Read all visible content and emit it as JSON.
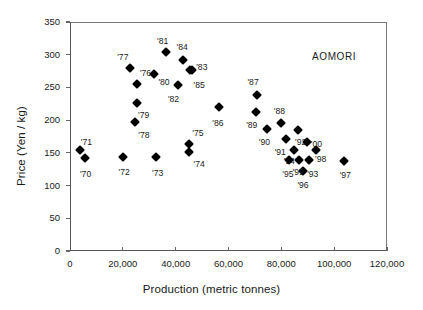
{
  "chart_data": {
    "type": "scatter",
    "title": "",
    "annotation": "AOMORI",
    "xlabel": "Production (metric tonnes)",
    "ylabel": "Price (Yen / kg)",
    "xlim": [
      0,
      120000
    ],
    "ylim": [
      0,
      350
    ],
    "xticks": [
      0,
      20000,
      40000,
      60000,
      80000,
      100000,
      120000
    ],
    "xticklabels": [
      "0",
      "20,000",
      "40,000",
      "60,000",
      "80,000",
      "100,000",
      "120,000"
    ],
    "yticks": [
      0,
      50,
      100,
      150,
      200,
      250,
      300,
      350
    ],
    "yticklabels": [
      "0",
      "50",
      "100",
      "150",
      "200",
      "250",
      "300",
      "350"
    ],
    "grid": false,
    "legend": "none",
    "marker": "filled-diamond",
    "marker_color": "#000000",
    "points": [
      {
        "label": "'70",
        "x": 5700,
        "y": 142,
        "lx": 5900,
        "ly": 118
      },
      {
        "label": "'71",
        "x": 3900,
        "y": 155,
        "lx": 6200,
        "ly": 167
      },
      {
        "label": "'72",
        "x": 20100,
        "y": 144,
        "lx": 20500,
        "ly": 120
      },
      {
        "label": "'73",
        "x": 32600,
        "y": 143,
        "lx": 33200,
        "ly": 119
      },
      {
        "label": "'74",
        "x": 44900,
        "y": 152,
        "lx": 48900,
        "ly": 133
      },
      {
        "label": "'75",
        "x": 44900,
        "y": 163,
        "lx": 48400,
        "ly": 181
      },
      {
        "label": "'76",
        "x": 25500,
        "y": 256,
        "lx": 28600,
        "ly": 272
      },
      {
        "label": "'77",
        "x": 22900,
        "y": 280,
        "lx": 20000,
        "ly": 296
      },
      {
        "label": "'78",
        "x": 24600,
        "y": 197,
        "lx": 28000,
        "ly": 178
      },
      {
        "label": "'79",
        "x": 25300,
        "y": 226,
        "lx": 27900,
        "ly": 208
      },
      {
        "label": "'80",
        "x": 31800,
        "y": 270,
        "lx": 35600,
        "ly": 258
      },
      {
        "label": "'81",
        "x": 36500,
        "y": 304,
        "lx": 35100,
        "ly": 321
      },
      {
        "label": "'82",
        "x": 40800,
        "y": 254,
        "lx": 39200,
        "ly": 233
      },
      {
        "label": "'83",
        "x": 46200,
        "y": 277,
        "lx": 49900,
        "ly": 281
      },
      {
        "label": "'84",
        "x": 42900,
        "y": 292,
        "lx": 42500,
        "ly": 312
      },
      {
        "label": "'85",
        "x": 45300,
        "y": 277,
        "lx": 48900,
        "ly": 253
      },
      {
        "label": "'86",
        "x": 56500,
        "y": 220,
        "lx": 56000,
        "ly": 196
      },
      {
        "label": "'87",
        "x": 70800,
        "y": 238,
        "lx": 69300,
        "ly": 259
      },
      {
        "label": "'88",
        "x": 79800,
        "y": 196,
        "lx": 79300,
        "ly": 214
      },
      {
        "label": "'89",
        "x": 70300,
        "y": 213,
        "lx": 68800,
        "ly": 192
      },
      {
        "label": "'90",
        "x": 74500,
        "y": 186,
        "lx": 73600,
        "ly": 166
      },
      {
        "label": "'91",
        "x": 81800,
        "y": 171,
        "lx": 79600,
        "ly": 152
      },
      {
        "label": "'92",
        "x": 86400,
        "y": 185,
        "lx": 87300,
        "ly": 166
      },
      {
        "label": "'93",
        "x": 90600,
        "y": 139,
        "lx": 91900,
        "ly": 118
      },
      {
        "label": "'94",
        "x": 84700,
        "y": 155,
        "lx": 83000,
        "ly": 138
      },
      {
        "label": "'95",
        "x": 82900,
        "y": 139,
        "lx": 82500,
        "ly": 117
      },
      {
        "label": "'96",
        "x": 88200,
        "y": 122,
        "lx": 88200,
        "ly": 101
      },
      {
        "label": "'97",
        "x": 103800,
        "y": 137,
        "lx": 104200,
        "ly": 116
      },
      {
        "label": "'98",
        "x": 93200,
        "y": 155,
        "lx": 94900,
        "ly": 140
      },
      {
        "label": "'99",
        "x": 86700,
        "y": 139,
        "lx": 86400,
        "ly": 121
      },
      {
        "label": "'00",
        "x": 89800,
        "y": 166,
        "lx": 93300,
        "ly": 163
      }
    ]
  }
}
